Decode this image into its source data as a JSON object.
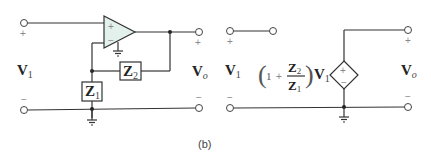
{
  "figure": {
    "caption": "(b)",
    "colors": {
      "wire": "#333333",
      "opamp_fill": "#e3f1ed",
      "terminal_fill": "#ffffff",
      "polarity_marks": "#888888"
    }
  },
  "left_circuit": {
    "input": {
      "label": "V",
      "subscript": "1",
      "plus": "+",
      "minus": "−"
    },
    "output": {
      "label": "V",
      "subscript": "o",
      "plus": "+",
      "minus": "−"
    },
    "opamp": {
      "noninverting": "+",
      "inverting": "−"
    },
    "z1": {
      "label": "Z",
      "subscript": "1"
    },
    "z2": {
      "label": "Z",
      "subscript": "2"
    }
  },
  "right_circuit": {
    "input": {
      "label": "V",
      "subscript": "1",
      "plus": "+",
      "minus": "−"
    },
    "output": {
      "label": "V",
      "subscript": "o",
      "plus": "+",
      "minus": "−"
    },
    "gain_expression": {
      "one": "1",
      "plus": "+",
      "numerator": {
        "label": "Z",
        "subscript": "2"
      },
      "denominator": {
        "label": "Z",
        "subscript": "1"
      },
      "times": {
        "label": "V",
        "subscript": "1"
      }
    },
    "source": {
      "plus": "+",
      "minus": "−"
    }
  }
}
